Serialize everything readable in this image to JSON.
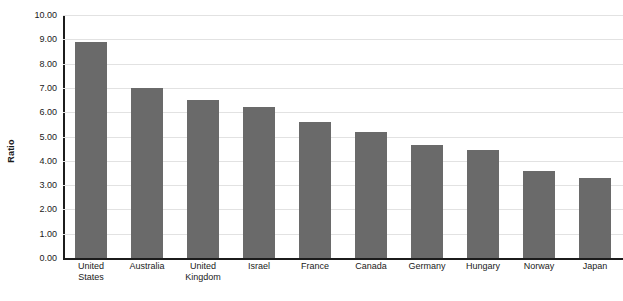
{
  "chart_data": {
    "type": "bar",
    "title": "",
    "subtitle": "",
    "xlabel": "",
    "ylabel": "Ratio",
    "ylim": [
      0,
      10
    ],
    "ytick_step": 1,
    "ytick_labels": [
      "10.00",
      "9.00",
      "8.00",
      "7.00",
      "6.00",
      "5.00",
      "4.00",
      "3.00",
      "2.00",
      "1.00",
      "0.00"
    ],
    "ytick_values": [
      10,
      9,
      8,
      7,
      6,
      5,
      4,
      3,
      2,
      1,
      0
    ],
    "grid": true,
    "legend": false,
    "legend_position": "none",
    "bar_color": "#6a6a6a",
    "categories": [
      "United States",
      "Australia",
      "United Kingdom",
      "Israel",
      "France",
      "Canada",
      "Germany",
      "Hungary",
      "Norway",
      "Japan"
    ],
    "category_lines": [
      [
        "United",
        "States"
      ],
      [
        "Australia",
        ""
      ],
      [
        "United",
        "Kingdom"
      ],
      [
        "Israel",
        ""
      ],
      [
        "France",
        ""
      ],
      [
        "Canada",
        ""
      ],
      [
        "Germany",
        ""
      ],
      [
        "Hungary",
        ""
      ],
      [
        "Norway",
        ""
      ],
      [
        "Japan",
        ""
      ]
    ],
    "values": [
      8.9,
      7.0,
      6.5,
      6.2,
      5.6,
      5.2,
      4.65,
      4.45,
      3.6,
      3.3
    ]
  },
  "colors": {
    "bar": "#6a6a6a",
    "gridline": "#e2e2e2",
    "axis": "#1c1c1c",
    "text": "#1a1a1a",
    "background": "#ffffff"
  }
}
